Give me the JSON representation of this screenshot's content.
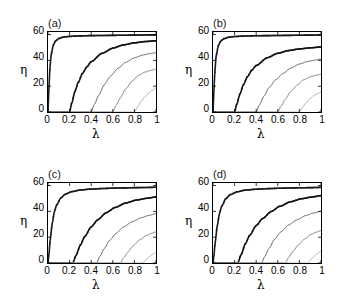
{
  "figure": {
    "width": 337,
    "height": 306,
    "background": "#ffffff",
    "panel_labels": [
      "(a)",
      "(b)",
      "(c)",
      "(d)"
    ]
  },
  "axis": {
    "xlabel": "λ",
    "ylabel": "η",
    "xticks": [
      "0",
      "0.2",
      "0.4",
      "0.6",
      "0.8",
      "1"
    ],
    "xtick_values": [
      0,
      0.2,
      0.4,
      0.6,
      0.8,
      1
    ],
    "yticks": [
      "0",
      "20",
      "40",
      "60"
    ],
    "ytick_values": [
      0,
      20,
      40,
      60
    ],
    "xlim": [
      0,
      1
    ],
    "ylim": [
      0,
      62
    ],
    "grid": false,
    "legend": "none"
  },
  "colors": {
    "curve_1": "#1a1a1a",
    "curve_2": "#111111",
    "curve_3": "#555555",
    "curve_4": "#777777",
    "curve_5": "#aaaaaa",
    "axis": "#000000",
    "text": "#000000"
  },
  "chart_data": [
    {
      "type": "line",
      "title": "(a)",
      "xlabel": "λ",
      "ylabel": "η",
      "xlim": [
        0,
        1
      ],
      "ylim": [
        0,
        62
      ],
      "grid": false,
      "legend": "none",
      "series": [
        {
          "name": "curve-1",
          "marker": "square",
          "linewidth": 1.6,
          "color": "#1a1a1a",
          "threshold": 0.0,
          "saturation": 59,
          "sharpness": 28,
          "x": [
            0.0,
            0.01,
            0.02,
            0.03,
            0.05,
            0.07,
            0.1,
            0.15,
            0.2,
            0.3,
            0.4,
            0.5,
            0.6,
            0.7,
            0.8,
            0.9,
            1.0
          ],
          "y": [
            0.0,
            22.0,
            37.0,
            45.0,
            52.0,
            55.0,
            57.0,
            58.2,
            58.6,
            59.0,
            59.2,
            59.3,
            59.4,
            59.5,
            59.6,
            59.7,
            59.8
          ]
        },
        {
          "name": "curve-2",
          "marker": "square",
          "linewidth": 1.6,
          "color": "#111111",
          "threshold": 0.2,
          "saturation": 55,
          "sharpness": 8,
          "x": [
            0.0,
            0.1,
            0.2,
            0.22,
            0.25,
            0.28,
            0.32,
            0.36,
            0.4,
            0.5,
            0.6,
            0.7,
            0.8,
            0.9,
            1.0
          ],
          "y": [
            0.0,
            0.0,
            0.0,
            7.0,
            16.0,
            23.0,
            30.0,
            35.0,
            39.0,
            45.5,
            49.5,
            52.0,
            53.6,
            54.6,
            55.2
          ]
        },
        {
          "name": "curve-3",
          "marker": "none",
          "linewidth": 0.9,
          "color": "#555555",
          "threshold": 0.4,
          "saturation": 46,
          "sharpness": 5,
          "x": [
            0.0,
            0.2,
            0.4,
            0.43,
            0.47,
            0.52,
            0.58,
            0.65,
            0.72,
            0.8,
            0.88,
            0.94,
            1.0
          ],
          "y": [
            0.0,
            0.0,
            0.0,
            6.0,
            13.0,
            21.0,
            28.0,
            34.0,
            38.5,
            42.0,
            44.2,
            45.2,
            46.0
          ]
        },
        {
          "name": "curve-4",
          "marker": "none",
          "linewidth": 0.9,
          "color": "#777777",
          "threshold": 0.6,
          "saturation": 33,
          "sharpness": 5,
          "x": [
            0.0,
            0.3,
            0.6,
            0.63,
            0.67,
            0.72,
            0.78,
            0.84,
            0.9,
            0.95,
            1.0
          ],
          "y": [
            0.0,
            0.0,
            0.0,
            5.0,
            11.0,
            18.0,
            24.0,
            28.5,
            31.0,
            32.2,
            33.2
          ]
        },
        {
          "name": "curve-5",
          "marker": "none",
          "linewidth": 0.9,
          "color": "#aaaaaa",
          "threshold": 0.8,
          "saturation": 18,
          "sharpness": 5,
          "x": [
            0.0,
            0.4,
            0.8,
            0.83,
            0.86,
            0.9,
            0.94,
            0.97,
            1.0
          ],
          "y": [
            0.0,
            0.0,
            0.0,
            4.0,
            8.0,
            12.0,
            15.3,
            17.0,
            18.5
          ]
        }
      ]
    },
    {
      "type": "line",
      "title": "(b)",
      "xlabel": "λ",
      "ylabel": "η",
      "xlim": [
        0,
        1
      ],
      "ylim": [
        0,
        62
      ],
      "grid": false,
      "legend": "none",
      "series": [
        {
          "name": "curve-1",
          "marker": "square",
          "linewidth": 1.6,
          "color": "#1a1a1a",
          "threshold": 0.0,
          "saturation": 59,
          "sharpness": 28,
          "x": [
            0.0,
            0.01,
            0.02,
            0.03,
            0.05,
            0.07,
            0.1,
            0.15,
            0.2,
            0.3,
            0.4,
            0.5,
            0.6,
            0.7,
            0.8,
            0.9,
            1.0
          ],
          "y": [
            0.0,
            20.0,
            35.0,
            44.0,
            51.5,
            54.8,
            56.8,
            58.0,
            58.5,
            58.9,
            59.1,
            59.2,
            59.3,
            59.4,
            59.5,
            59.6,
            59.7
          ]
        },
        {
          "name": "curve-2",
          "marker": "square",
          "linewidth": 1.6,
          "color": "#111111",
          "threshold": 0.2,
          "saturation": 50,
          "sharpness": 8,
          "x": [
            0.0,
            0.1,
            0.2,
            0.22,
            0.25,
            0.28,
            0.32,
            0.36,
            0.4,
            0.5,
            0.6,
            0.7,
            0.8,
            0.9,
            1.0
          ],
          "y": [
            0.0,
            0.0,
            0.0,
            6.0,
            14.0,
            21.0,
            27.5,
            32.5,
            36.0,
            42.0,
            45.5,
            47.6,
            48.9,
            49.7,
            50.4
          ]
        },
        {
          "name": "curve-3",
          "marker": "none",
          "linewidth": 0.9,
          "color": "#555555",
          "threshold": 0.4,
          "saturation": 41,
          "sharpness": 5,
          "x": [
            0.0,
            0.2,
            0.4,
            0.43,
            0.47,
            0.52,
            0.58,
            0.65,
            0.72,
            0.8,
            0.88,
            0.94,
            1.0
          ],
          "y": [
            0.0,
            0.0,
            0.0,
            5.5,
            12.0,
            19.0,
            25.0,
            30.0,
            34.0,
            37.2,
            39.2,
            40.2,
            41.0
          ]
        },
        {
          "name": "curve-4",
          "marker": "none",
          "linewidth": 0.9,
          "color": "#777777",
          "threshold": 0.6,
          "saturation": 29,
          "sharpness": 5,
          "x": [
            0.0,
            0.3,
            0.6,
            0.63,
            0.67,
            0.72,
            0.78,
            0.84,
            0.9,
            0.95,
            1.0
          ],
          "y": [
            0.0,
            0.0,
            0.0,
            4.5,
            10.0,
            16.0,
            21.0,
            25.0,
            27.3,
            28.4,
            29.2
          ]
        },
        {
          "name": "curve-5",
          "marker": "none",
          "linewidth": 0.9,
          "color": "#aaaaaa",
          "threshold": 0.8,
          "saturation": 15,
          "sharpness": 5,
          "x": [
            0.0,
            0.4,
            0.8,
            0.83,
            0.86,
            0.9,
            0.94,
            0.97,
            1.0
          ],
          "y": [
            0.0,
            0.0,
            0.0,
            3.5,
            7.0,
            10.5,
            13.0,
            14.3,
            15.5
          ]
        }
      ]
    },
    {
      "type": "line",
      "title": "(c)",
      "xlabel": "λ",
      "ylabel": "η",
      "xlim": [
        0,
        1
      ],
      "ylim": [
        0,
        62
      ],
      "grid": false,
      "legend": "none",
      "series": [
        {
          "name": "curve-1",
          "marker": "square",
          "linewidth": 1.6,
          "color": "#1a1a1a",
          "threshold": 0.0,
          "saturation": 58.5,
          "sharpness": 11,
          "x": [
            0.0,
            0.01,
            0.02,
            0.04,
            0.06,
            0.08,
            0.12,
            0.16,
            0.22,
            0.3,
            0.4,
            0.5,
            0.6,
            0.7,
            0.8,
            0.9,
            1.0
          ],
          "y": [
            0.0,
            8.0,
            18.0,
            31.0,
            40.0,
            45.0,
            50.5,
            53.3,
            55.3,
            56.6,
            57.3,
            57.7,
            58.0,
            58.2,
            58.4,
            58.5,
            58.7
          ]
        },
        {
          "name": "curve-2",
          "marker": "square",
          "linewidth": 1.6,
          "color": "#111111",
          "threshold": 0.23,
          "saturation": 51,
          "sharpness": 7,
          "x": [
            0.0,
            0.12,
            0.23,
            0.26,
            0.3,
            0.34,
            0.4,
            0.46,
            0.54,
            0.62,
            0.72,
            0.82,
            0.92,
            1.0
          ],
          "y": [
            0.0,
            0.0,
            0.0,
            6.0,
            14.0,
            20.5,
            28.0,
            33.5,
            39.0,
            43.0,
            46.5,
            48.8,
            50.2,
            51.2
          ]
        },
        {
          "name": "curve-3",
          "marker": "none",
          "linewidth": 0.9,
          "color": "#555555",
          "threshold": 0.45,
          "saturation": 38,
          "sharpness": 5,
          "x": [
            0.0,
            0.22,
            0.45,
            0.48,
            0.52,
            0.57,
            0.63,
            0.7,
            0.78,
            0.86,
            0.93,
            1.0
          ],
          "y": [
            0.0,
            0.0,
            0.0,
            5.0,
            11.0,
            17.5,
            23.0,
            28.0,
            32.0,
            35.0,
            36.8,
            38.2
          ]
        },
        {
          "name": "curve-4",
          "marker": "none",
          "linewidth": 0.9,
          "color": "#777777",
          "threshold": 0.67,
          "saturation": 24,
          "sharpness": 5,
          "x": [
            0.0,
            0.33,
            0.67,
            0.7,
            0.74,
            0.79,
            0.85,
            0.91,
            0.96,
            1.0
          ],
          "y": [
            0.0,
            0.0,
            0.0,
            4.0,
            8.5,
            13.5,
            18.0,
            21.3,
            23.0,
            24.2
          ]
        },
        {
          "name": "curve-5",
          "marker": "none",
          "linewidth": 0.9,
          "color": "#aaaaaa",
          "threshold": 0.88,
          "saturation": 8,
          "sharpness": 5,
          "x": [
            0.0,
            0.44,
            0.88,
            0.9,
            0.93,
            0.96,
            0.98,
            1.0
          ],
          "y": [
            0.0,
            0.0,
            0.0,
            2.0,
            4.3,
            6.3,
            7.4,
            8.4
          ]
        }
      ]
    },
    {
      "type": "line",
      "title": "(d)",
      "xlabel": "λ",
      "ylabel": "η",
      "xlim": [
        0,
        1
      ],
      "ylim": [
        0,
        62
      ],
      "grid": false,
      "legend": "none",
      "series": [
        {
          "name": "curve-1",
          "marker": "square",
          "linewidth": 1.6,
          "color": "#1a1a1a",
          "threshold": 0.0,
          "saturation": 58.5,
          "sharpness": 10,
          "x": [
            0.0,
            0.01,
            0.02,
            0.04,
            0.06,
            0.08,
            0.12,
            0.16,
            0.22,
            0.3,
            0.4,
            0.5,
            0.6,
            0.7,
            0.8,
            0.9,
            1.0
          ],
          "y": [
            0.0,
            7.0,
            16.0,
            29.0,
            38.5,
            44.0,
            50.0,
            53.0,
            55.1,
            56.5,
            57.2,
            57.6,
            57.9,
            58.1,
            58.3,
            58.4,
            58.6
          ]
        },
        {
          "name": "curve-2",
          "marker": "square",
          "linewidth": 1.6,
          "color": "#111111",
          "threshold": 0.23,
          "saturation": 52,
          "sharpness": 7,
          "x": [
            0.0,
            0.12,
            0.23,
            0.26,
            0.3,
            0.34,
            0.4,
            0.46,
            0.54,
            0.62,
            0.72,
            0.82,
            0.92,
            1.0
          ],
          "y": [
            0.0,
            0.0,
            0.0,
            6.5,
            15.0,
            21.5,
            29.0,
            34.5,
            40.0,
            44.0,
            47.5,
            49.8,
            51.2,
            52.2
          ]
        },
        {
          "name": "curve-3",
          "marker": "none",
          "linewidth": 0.9,
          "color": "#555555",
          "threshold": 0.45,
          "saturation": 40,
          "sharpness": 5,
          "x": [
            0.0,
            0.22,
            0.45,
            0.48,
            0.52,
            0.57,
            0.63,
            0.7,
            0.78,
            0.86,
            0.93,
            1.0
          ],
          "y": [
            0.0,
            0.0,
            0.0,
            5.2,
            11.5,
            18.5,
            24.2,
            29.5,
            33.6,
            36.8,
            38.7,
            40.1
          ]
        },
        {
          "name": "curve-4",
          "marker": "none",
          "linewidth": 0.9,
          "color": "#777777",
          "threshold": 0.67,
          "saturation": 25,
          "sharpness": 5,
          "x": [
            0.0,
            0.33,
            0.67,
            0.7,
            0.74,
            0.79,
            0.85,
            0.91,
            0.96,
            1.0
          ],
          "y": [
            0.0,
            0.0,
            0.0,
            4.2,
            9.0,
            14.0,
            18.8,
            22.2,
            24.0,
            25.2
          ]
        },
        {
          "name": "curve-5",
          "marker": "none",
          "linewidth": 0.9,
          "color": "#aaaaaa",
          "threshold": 0.88,
          "saturation": 9,
          "sharpness": 5,
          "x": [
            0.0,
            0.44,
            0.88,
            0.9,
            0.93,
            0.96,
            0.98,
            1.0
          ],
          "y": [
            0.0,
            0.0,
            0.0,
            2.2,
            4.7,
            6.9,
            8.2,
            9.3
          ]
        }
      ]
    }
  ]
}
